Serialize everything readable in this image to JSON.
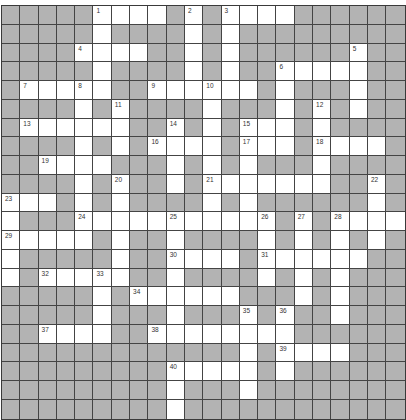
{
  "puzzle": {
    "cols": 22,
    "rows": 22,
    "colors": {
      "block": "#b3b3b3",
      "open": "#ffffff",
      "line": "#444444"
    },
    "open_cells_by_row": [
      [
        5,
        6,
        7,
        8,
        10,
        12,
        13,
        14,
        15
      ],
      [
        5,
        10,
        12
      ],
      [
        4,
        5,
        6,
        7,
        10,
        12,
        19
      ],
      [
        5,
        10,
        12,
        15,
        16,
        17,
        18,
        19
      ],
      [
        1,
        2,
        3,
        4,
        5,
        8,
        9,
        10,
        11,
        12,
        13,
        15,
        19
      ],
      [
        4,
        6,
        11,
        15,
        17,
        19
      ],
      [
        1,
        2,
        3,
        4,
        5,
        6,
        9,
        11,
        13,
        14,
        15,
        17
      ],
      [
        4,
        6,
        8,
        9,
        10,
        11,
        13,
        14,
        15,
        17,
        18,
        19,
        20
      ],
      [
        2,
        3,
        4,
        5,
        9,
        11,
        13,
        17
      ],
      [
        4,
        6,
        9,
        11,
        12,
        13,
        14,
        15,
        16,
        17,
        20
      ],
      [
        0,
        1,
        2,
        4,
        6,
        11,
        13,
        20
      ],
      [
        0,
        4,
        5,
        6,
        7,
        8,
        9,
        10,
        11,
        12,
        13,
        14,
        16,
        18,
        19,
        20,
        21
      ],
      [
        0,
        1,
        2,
        3,
        4,
        6,
        9,
        14,
        16,
        18,
        20
      ],
      [
        0,
        6,
        9,
        10,
        11,
        12,
        14,
        15,
        16,
        17,
        18,
        19
      ],
      [
        0,
        2,
        3,
        4,
        5,
        6,
        9,
        14,
        16,
        18
      ],
      [
        5,
        7,
        8,
        9,
        10,
        11,
        12,
        16,
        18
      ],
      [
        5,
        9,
        13,
        15,
        18
      ],
      [
        2,
        3,
        4,
        5,
        8,
        9,
        10,
        11,
        12,
        13,
        14,
        15
      ],
      [
        13,
        15,
        16,
        17,
        18
      ],
      [
        9,
        10,
        11,
        12,
        13,
        15
      ],
      [
        9,
        13
      ],
      [
        9
      ]
    ],
    "clue_numbers": [
      {
        "n": "1",
        "r": 0,
        "c": 5
      },
      {
        "n": "2",
        "r": 0,
        "c": 10
      },
      {
        "n": "3",
        "r": 0,
        "c": 12
      },
      {
        "n": "4",
        "r": 2,
        "c": 4
      },
      {
        "n": "5",
        "r": 2,
        "c": 19
      },
      {
        "n": "6",
        "r": 3,
        "c": 15
      },
      {
        "n": "7",
        "r": 4,
        "c": 1
      },
      {
        "n": "8",
        "r": 4,
        "c": 4
      },
      {
        "n": "9",
        "r": 4,
        "c": 8
      },
      {
        "n": "10",
        "r": 4,
        "c": 11
      },
      {
        "n": "11",
        "r": 5,
        "c": 6
      },
      {
        "n": "12",
        "r": 5,
        "c": 17
      },
      {
        "n": "13",
        "r": 6,
        "c": 1
      },
      {
        "n": "14",
        "r": 6,
        "c": 9
      },
      {
        "n": "15",
        "r": 6,
        "c": 13
      },
      {
        "n": "16",
        "r": 7,
        "c": 8
      },
      {
        "n": "17",
        "r": 7,
        "c": 13
      },
      {
        "n": "18",
        "r": 7,
        "c": 17
      },
      {
        "n": "19",
        "r": 8,
        "c": 2
      },
      {
        "n": "20",
        "r": 9,
        "c": 6
      },
      {
        "n": "21",
        "r": 9,
        "c": 11
      },
      {
        "n": "22",
        "r": 9,
        "c": 20
      },
      {
        "n": "23",
        "r": 10,
        "c": 0
      },
      {
        "n": "24",
        "r": 11,
        "c": 4
      },
      {
        "n": "25",
        "r": 11,
        "c": 9
      },
      {
        "n": "26",
        "r": 11,
        "c": 14
      },
      {
        "n": "27",
        "r": 11,
        "c": 16
      },
      {
        "n": "28",
        "r": 11,
        "c": 18
      },
      {
        "n": "29",
        "r": 12,
        "c": 0
      },
      {
        "n": "30",
        "r": 13,
        "c": 9
      },
      {
        "n": "31",
        "r": 13,
        "c": 14
      },
      {
        "n": "32",
        "r": 14,
        "c": 2
      },
      {
        "n": "33",
        "r": 14,
        "c": 5
      },
      {
        "n": "34",
        "r": 15,
        "c": 7
      },
      {
        "n": "35",
        "r": 16,
        "c": 13
      },
      {
        "n": "36",
        "r": 16,
        "c": 15
      },
      {
        "n": "37",
        "r": 17,
        "c": 2
      },
      {
        "n": "38",
        "r": 17,
        "c": 8
      },
      {
        "n": "39",
        "r": 18,
        "c": 15
      },
      {
        "n": "40",
        "r": 19,
        "c": 9
      }
    ]
  }
}
